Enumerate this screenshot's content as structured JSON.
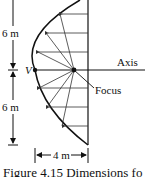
{
  "figure": {
    "caption": "Figure 4.15  Dimensions fo",
    "labels": {
      "top_height": "6 m",
      "bottom_height": "6 m",
      "vertex": "V",
      "axis": "Axis",
      "focus": "Focus",
      "depth": "4 m"
    },
    "colors": {
      "line": "#111111",
      "ray": "#444444",
      "background": "#ffffff"
    },
    "geometry": {
      "vertex_px": [
        35,
        70
      ],
      "focus_px": [
        74,
        70
      ],
      "aperture_x_px": 88,
      "aperture_half_height_m": 6,
      "depth_m": 4
    }
  }
}
